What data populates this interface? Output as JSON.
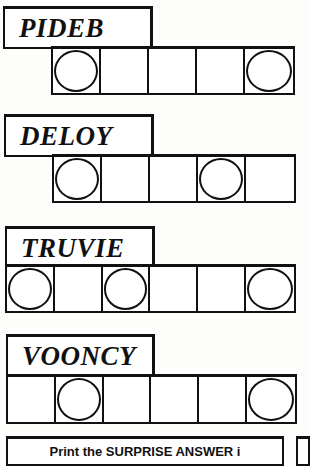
{
  "puzzles": [
    {
      "scrambled": "PIDEB",
      "cell_count": 5,
      "circled": [
        0,
        4
      ]
    },
    {
      "scrambled": "DELOY",
      "cell_count": 5,
      "circled": [
        0,
        3
      ]
    },
    {
      "scrambled": "TRUVIE",
      "cell_count": 6,
      "circled": [
        0,
        2,
        5
      ]
    },
    {
      "scrambled": "VOONCY",
      "cell_count": 6,
      "circled": [
        1,
        5
      ]
    }
  ],
  "instructions": {
    "text": "Print the SURPRISE ANSWER i"
  },
  "colors": {
    "ink": "#111111",
    "paper": "#fdfdfb"
  }
}
